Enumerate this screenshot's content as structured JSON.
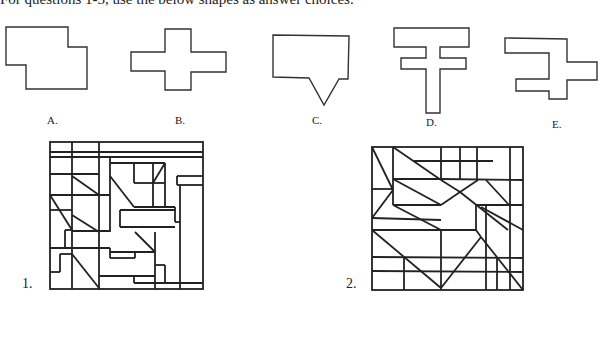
{
  "instruction": "For questions 1-5, use the below shapes as answer choices.",
  "choices": [
    {
      "label": "A.",
      "shape": "step-rectangle"
    },
    {
      "label": "B.",
      "shape": "cross"
    },
    {
      "label": "C.",
      "shape": "speech-bubble"
    },
    {
      "label": "D.",
      "shape": "double-bar-t"
    },
    {
      "label": "E.",
      "shape": "zigzag-cross"
    }
  ],
  "puzzles": [
    {
      "number": "1."
    },
    {
      "number": "2."
    }
  ]
}
